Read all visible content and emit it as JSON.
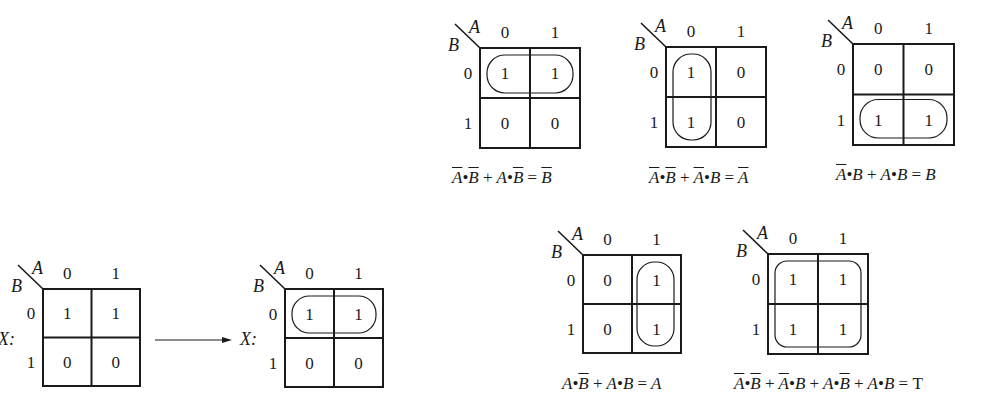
{
  "maps": [
    {
      "id": "x-before",
      "x": 43,
      "y": 289,
      "size": 97,
      "label": "X:",
      "cells": [
        [
          "1",
          "1"
        ],
        [
          "0",
          "0"
        ]
      ],
      "loop": null
    },
    {
      "id": "x-after",
      "x": 285,
      "y": 289,
      "size": 98,
      "label": "X:",
      "cells": [
        [
          "1",
          "1"
        ],
        [
          "0",
          "0"
        ]
      ],
      "loop": "row0"
    },
    {
      "id": "map-not-b",
      "x": 480,
      "y": 48,
      "size": 100,
      "cells": [
        [
          "1",
          "1"
        ],
        [
          "0",
          "0"
        ]
      ],
      "loop": "row0"
    },
    {
      "id": "map-not-a",
      "x": 666,
      "y": 47,
      "size": 100,
      "cells": [
        [
          "1",
          "0"
        ],
        [
          "1",
          "0"
        ]
      ],
      "loop": "col0"
    },
    {
      "id": "map-b",
      "x": 853,
      "y": 44,
      "size": 101,
      "cells": [
        [
          "0",
          "0"
        ],
        [
          "1",
          "1"
        ]
      ],
      "loop": "row1"
    },
    {
      "id": "map-a",
      "x": 583,
      "y": 255,
      "size": 98,
      "cells": [
        [
          "0",
          "1"
        ],
        [
          "0",
          "1"
        ]
      ],
      "loop": "col1"
    },
    {
      "id": "map-t",
      "x": 768,
      "y": 254,
      "size": 100,
      "cells": [
        [
          "1",
          "1"
        ],
        [
          "1",
          "1"
        ]
      ],
      "loop": "all"
    }
  ],
  "axis": {
    "col_var": "A",
    "row_var": "B",
    "col_labels": [
      "0",
      "1"
    ],
    "row_labels": [
      "0",
      "1"
    ]
  },
  "arrow": {
    "x1": 155,
    "y1": 340,
    "x2": 232,
    "y2": 340
  },
  "equations": {
    "eq1": {
      "a": "A",
      "b": "B",
      "plus": "+",
      "eqsign": "=",
      "bullet": "•"
    },
    "t_symbol": "T"
  }
}
